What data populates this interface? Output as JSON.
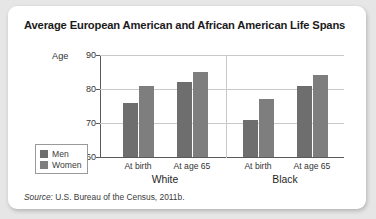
{
  "card": {
    "title": "Average European American and African American Life Spans",
    "source_prefix": "Source:",
    "source_text": " U.S. Bureau of the Census, 2011b."
  },
  "legend": {
    "items": [
      {
        "label": "Men",
        "color": "#6e6e6e"
      },
      {
        "label": "Women",
        "color": "#7e7e7e"
      }
    ]
  },
  "chart_data": {
    "type": "bar",
    "title": "Average European American and African American Life Spans",
    "xlabel": "",
    "ylabel": "Age",
    "ylim": [
      60,
      90
    ],
    "yticks": [
      60,
      70,
      80,
      90
    ],
    "ytick_labels": [
      "60",
      "70",
      "80",
      "90"
    ],
    "grid": true,
    "legend_position": "bottom-left",
    "group_labels": [
      "White",
      "Black"
    ],
    "categories": [
      "At birth",
      "At age 65",
      "At birth",
      "At age 65"
    ],
    "category_groups": [
      "White",
      "White",
      "Black",
      "Black"
    ],
    "series": [
      {
        "name": "Men",
        "color": "#6e6e6e",
        "values": [
          76,
          82,
          71,
          81
        ]
      },
      {
        "name": "Women",
        "color": "#7e7e7e",
        "values": [
          81,
          85,
          77,
          84
        ]
      }
    ],
    "source": "Source: U.S. Bureau of the Census, 2011b."
  }
}
